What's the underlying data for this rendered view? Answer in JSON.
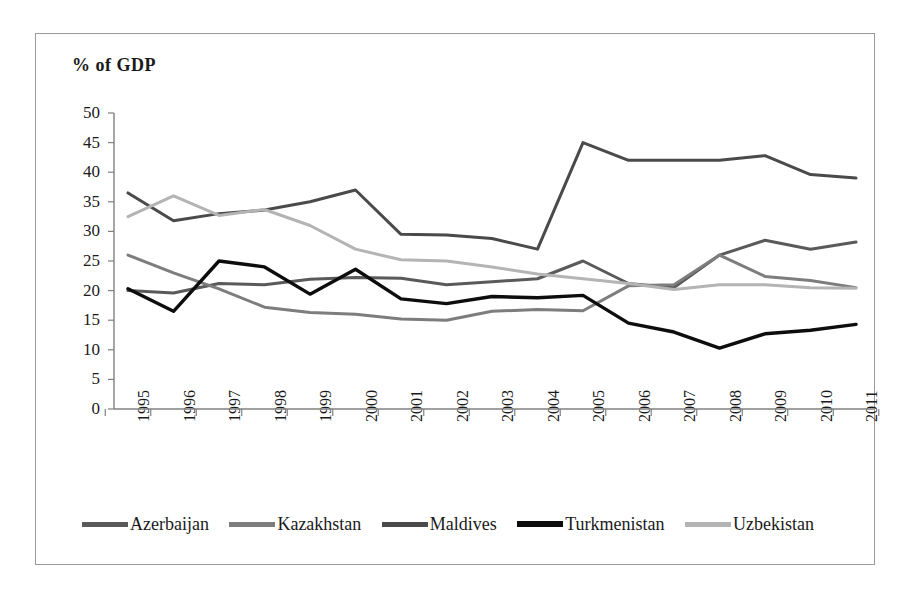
{
  "chart_data": {
    "type": "line",
    "title": "% of GDP",
    "xlabel": "",
    "ylabel": "% of GDP",
    "ylim": [
      0,
      50
    ],
    "ytick_step": 5,
    "grid": false,
    "legend_position": "bottom",
    "categories": [
      "1995",
      "1996",
      "1997",
      "1998",
      "1999",
      "2000",
      "2001",
      "2002",
      "2003",
      "2004",
      "2005",
      "2006",
      "2007",
      "2008",
      "2009",
      "2010",
      "2011"
    ],
    "yticks": [
      "50",
      "45",
      "40",
      "35",
      "30",
      "25",
      "20",
      "15",
      "10",
      "5",
      "0"
    ],
    "series": [
      {
        "name": "Azerbaijan",
        "color": "#5a5a5a",
        "values": [
          20.0,
          19.6,
          21.2,
          21.0,
          21.9,
          22.2,
          22.1,
          21.0,
          21.5,
          22.0,
          25.0,
          21.2,
          20.5,
          26.0,
          28.5,
          27.0,
          28.2
        ]
      },
      {
        "name": "Kazakhstan",
        "color": "#7d7d7d",
        "values": [
          26.0,
          23.0,
          20.3,
          17.2,
          16.3,
          16.0,
          15.2,
          15.0,
          16.5,
          16.8,
          16.6,
          20.8,
          21.0,
          26.0,
          22.4,
          21.7,
          20.5
        ]
      },
      {
        "name": "Maldives",
        "color": "#4a4a4a",
        "values": [
          36.5,
          31.8,
          33.0,
          33.6,
          35.0,
          37.0,
          29.5,
          29.4,
          28.8,
          27.0,
          45.0,
          42.0,
          42.0,
          42.0,
          42.8,
          39.6,
          39.0
        ]
      },
      {
        "name": "Turkmenistan",
        "color": "#0d0d0d",
        "values": [
          20.3,
          16.5,
          25.0,
          24.0,
          19.4,
          23.6,
          18.6,
          17.8,
          19.0,
          18.8,
          19.2,
          14.5,
          13.0,
          10.3,
          12.7,
          13.3,
          14.3
        ]
      },
      {
        "name": "Uzbekistan",
        "color": "#b4b4b4",
        "values": [
          32.5,
          36.0,
          32.7,
          33.7,
          31.0,
          27.0,
          25.2,
          25.0,
          24.0,
          22.8,
          22.0,
          21.2,
          20.2,
          21.0,
          21.0,
          20.5,
          20.4
        ]
      }
    ]
  }
}
